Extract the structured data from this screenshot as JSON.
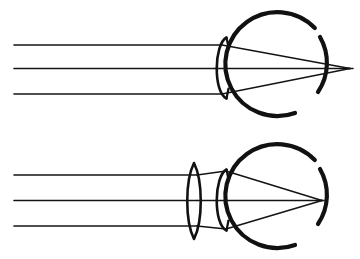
{
  "figure": {
    "background_color": "#ffffff",
    "ink_color": "#111111",
    "canvas": {
      "width": 360,
      "height": 259
    }
  },
  "panels": [
    {
      "id": "uncorrected-eye",
      "name": "uncorrected-eye-panel",
      "caption": "",
      "has_corrective_lens": false,
      "focus_relative_to_retina": "behind",
      "eyeball": {
        "center_x": 270,
        "center_y": 68,
        "radius": 52,
        "outline_gap_start_deg": 300,
        "outline_gap_end_deg": 340,
        "stroke_width": 4.2
      },
      "cornea": {
        "apex_x": 212,
        "top_y": 38,
        "bottom_y": 98,
        "bulge": 10
      },
      "pupil_stops": [
        {
          "x": 224,
          "y_top": 38,
          "y_bottom": 46
        },
        {
          "x": 224,
          "y_top": 90,
          "y_bottom": 98
        }
      ],
      "focal_point": {
        "x": 350,
        "y": 68
      },
      "retina_x": 322,
      "rays": [
        {
          "name": "upper-ray",
          "start_x": 14,
          "y": 45,
          "entry_x": 218
        },
        {
          "name": "axial-ray",
          "start_x": 14,
          "y": 68,
          "entry_x": 212
        },
        {
          "name": "lower-ray",
          "start_x": 14,
          "y": 94,
          "entry_x": 218
        }
      ]
    },
    {
      "id": "corrected-eye",
      "name": "corrected-eye-panel",
      "caption": "",
      "has_corrective_lens": true,
      "focus_relative_to_retina": "on-retina",
      "eyeball": {
        "center_x": 270,
        "center_y": 200,
        "radius": 52,
        "outline_gap_start_deg": 300,
        "outline_gap_end_deg": 340,
        "stroke_width": 4.2
      },
      "cornea": {
        "apex_x": 212,
        "top_y": 170,
        "bottom_y": 230,
        "bulge": 10
      },
      "pupil_stops": [
        {
          "x": 224,
          "y_top": 170,
          "y_bottom": 178
        },
        {
          "x": 224,
          "y_top": 222,
          "y_bottom": 230
        }
      ],
      "focal_point": {
        "x": 322,
        "y": 200
      },
      "retina_x": 322,
      "corrective_lens": {
        "name": "biconvex-converging-lens",
        "center_x": 194,
        "top_y": 163,
        "bottom_y": 239,
        "half_width": 8,
        "type": "biconvex"
      },
      "rays": [
        {
          "name": "upper-ray",
          "start_x": 14,
          "y": 175,
          "entry_x": 194
        },
        {
          "name": "axial-ray",
          "start_x": 14,
          "y": 200,
          "entry_x": 194
        },
        {
          "name": "lower-ray",
          "start_x": 14,
          "y": 226,
          "entry_x": 194
        }
      ]
    }
  ],
  "legend": {
    "items": [
      {
        "label": "Parallel incident light rays",
        "name": "legend-rays"
      },
      {
        "label": "Eyeball (sclera outline)",
        "name": "legend-eyeball"
      },
      {
        "label": "Cornea",
        "name": "legend-cornea"
      },
      {
        "label": "Converging (convex) lens",
        "name": "legend-lens"
      },
      {
        "label": "Focal point",
        "name": "legend-focal-point"
      }
    ],
    "visible": false
  }
}
